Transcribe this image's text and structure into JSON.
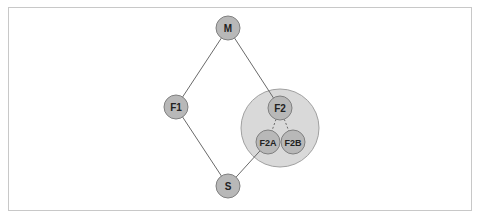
{
  "diagram": {
    "nodes": [
      {
        "id": "M",
        "label": "M",
        "x": 228,
        "y": 28
      },
      {
        "id": "F1",
        "label": "F1",
        "x": 176,
        "y": 107
      },
      {
        "id": "F2",
        "label": "F2",
        "x": 280,
        "y": 108
      },
      {
        "id": "F2A",
        "label": "F2A",
        "x": 268,
        "y": 142
      },
      {
        "id": "F2B",
        "label": "F2B",
        "x": 293,
        "y": 142
      },
      {
        "id": "S",
        "label": "S",
        "x": 228,
        "y": 186
      }
    ],
    "group": {
      "x": 280,
      "y": 128,
      "r": 39,
      "fill": "#d9d9d9"
    },
    "edges": [
      {
        "from": "M",
        "to": "F1",
        "style": "solid"
      },
      {
        "from": "M",
        "to": "F2",
        "style": "solid"
      },
      {
        "from": "F1",
        "to": "S",
        "style": "solid"
      },
      {
        "from": "F2A",
        "to": "S",
        "style": "solid"
      },
      {
        "from": "F2",
        "to": "F2A",
        "style": "dashed"
      },
      {
        "from": "F2",
        "to": "F2B",
        "style": "dashed"
      }
    ],
    "colors": {
      "node_fill": "#b8b8b8",
      "node_stroke": "#808080",
      "edge": "#6a6a6a"
    }
  }
}
